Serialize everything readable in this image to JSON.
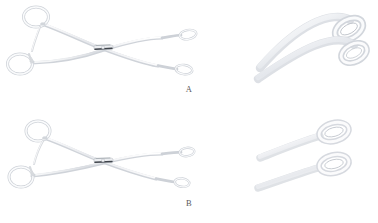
{
  "figure": {
    "background_color": "#ffffff",
    "caption_text_color": "#5a5a5a",
    "instrument_name": "sponge-holding-forceps",
    "panel_count": 2
  },
  "panels": [
    {
      "id": "A",
      "label": "A",
      "full_view": {
        "alt": "full-length sponge holding forceps, jaws open, viewed from side",
        "state": "open",
        "parts": [
          "finger-ring-upper",
          "finger-ring-lower",
          "ratchet-lock",
          "shank-upper",
          "shank-lower",
          "box-lock-hinge",
          "jaw-upper",
          "jaw-lower",
          "fenestrated-tip-upper",
          "fenestrated-tip-lower"
        ]
      },
      "closeup_view": {
        "alt": "magnified view of curved fenestrated oval jaw tips",
        "tip_shape": "oval-fenestrated",
        "tip_profile": "curved"
      }
    },
    {
      "id": "B",
      "label": "B",
      "full_view": {
        "alt": "full-length sponge holding forceps, jaws closed, viewed from side",
        "state": "closed",
        "parts": [
          "finger-ring-upper",
          "finger-ring-lower",
          "ratchet-lock",
          "shank-upper",
          "shank-lower",
          "box-lock-hinge",
          "jaw-upper",
          "jaw-lower",
          "fenestrated-tip-upper",
          "fenestrated-tip-lower"
        ]
      },
      "closeup_view": {
        "alt": "magnified view of straight fenestrated oval jaw tips",
        "tip_shape": "oval-fenestrated",
        "tip_profile": "straight"
      }
    }
  ],
  "colors": {
    "metal_light": "#fbfbfc",
    "metal_mid": "#e3e5e8",
    "metal_shadow": "#c6c9ce",
    "metal_dark": "#9aa0a7",
    "hinge_dark": "#4a4e55",
    "outline": "#d4d7dc"
  }
}
